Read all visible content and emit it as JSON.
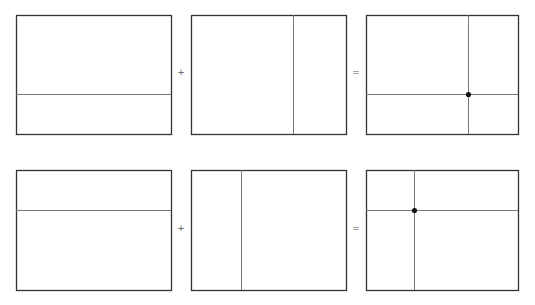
{
  "colors": {
    "frame": "#333333",
    "line": "#777777",
    "dot": "#111111"
  },
  "operators": {
    "plus": "+",
    "equals": "="
  },
  "rows": [
    {
      "top": 15,
      "bottom": 134,
      "op_y": 67,
      "operand_a": {
        "left": 16,
        "right": 171,
        "hline": 94
      },
      "operand_b": {
        "left": 191,
        "right": 346,
        "vline": 293
      },
      "result": {
        "left": 366,
        "right": 518,
        "hline": 94,
        "vline": 468,
        "dot": [
          468,
          94
        ]
      }
    },
    {
      "top": 170,
      "bottom": 290,
      "op_y": 223,
      "operand_a": {
        "left": 16,
        "right": 171,
        "hline": 210
      },
      "operand_b": {
        "left": 191,
        "right": 346,
        "vline": 241
      },
      "result": {
        "left": 366,
        "right": 518,
        "hline": 210,
        "vline": 414,
        "dot": [
          414,
          210
        ]
      }
    }
  ]
}
